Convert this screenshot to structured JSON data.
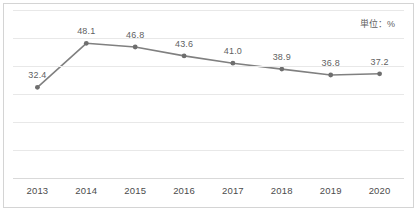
{
  "chart_data": {
    "type": "line",
    "title": "",
    "subtitle": "",
    "xlabel": "",
    "ylabel": "",
    "annotation": "単位：%",
    "categories": [
      "2013",
      "2014",
      "2015",
      "2016",
      "2017",
      "2018",
      "2019",
      "2020"
    ],
    "values": [
      32.4,
      48.1,
      46.8,
      43.6,
      41.0,
      38.9,
      36.8,
      37.2
    ],
    "data_labels": [
      "32.4",
      "48.1",
      "46.8",
      "43.6",
      "41.0",
      "38.9",
      "36.8",
      "37.2"
    ],
    "series": [
      {
        "name": "",
        "values": [
          32.4,
          48.1,
          46.8,
          43.6,
          41.0,
          38.9,
          36.8,
          37.2
        ],
        "color": "#808080",
        "marker": "circle"
      }
    ],
    "ylim": [
      0,
      60
    ],
    "gridlines": [
      0,
      10,
      20,
      30,
      40,
      50,
      60
    ],
    "grid": true,
    "grid_color": "#e8e8e8",
    "legend": false,
    "legend_position": "none",
    "line_color": "#808080",
    "marker_color": "#6e6e6e",
    "border_color": "#d4d4d4",
    "background": "#ffffff",
    "label_color": "#5f5f5f"
  }
}
